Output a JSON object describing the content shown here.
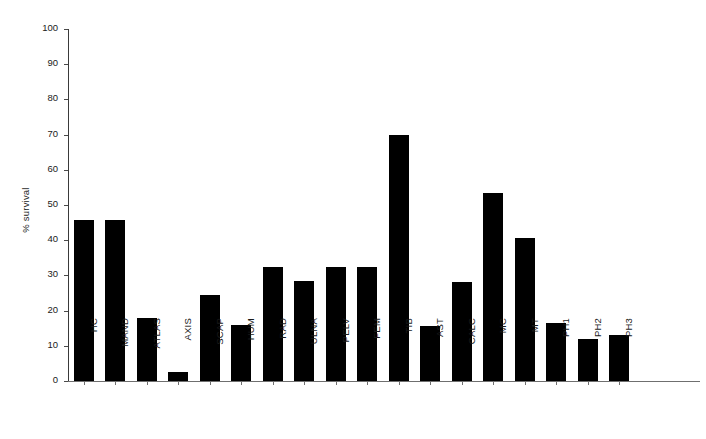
{
  "chart_data": {
    "type": "bar",
    "title": "",
    "xlabel": "",
    "ylabel": "% survival",
    "ylim": [
      0,
      100
    ],
    "yticks": [
      0,
      10,
      20,
      30,
      40,
      50,
      60,
      70,
      80,
      90,
      100
    ],
    "grid": false,
    "legend": null,
    "bar_color": "#000000",
    "categories": [
      "HC",
      "MAND",
      "ATLAS",
      "AXIS",
      "SCAP",
      "HUM",
      "RAD",
      "ULNA",
      "PELV",
      "FEM",
      "TIB",
      "AST",
      "CALC",
      "MC",
      "MT",
      "PH1",
      "PH2",
      "PH3"
    ],
    "values": [
      45.8,
      45.8,
      18.0,
      2.5,
      24.5,
      16.0,
      32.5,
      28.5,
      32.5,
      32.3,
      70.0,
      15.7,
      28.0,
      53.3,
      40.5,
      16.5,
      12.0,
      13.0
    ]
  }
}
